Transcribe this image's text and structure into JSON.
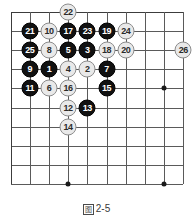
{
  "figure": {
    "caption": "图2-5",
    "caption_prefix_symbol": "图",
    "caption_number": "2-5"
  },
  "board": {
    "type": "go-board-corner-diagram",
    "columns": 10,
    "rows": 10,
    "left_edge_is_board_edge": true,
    "top_edge_is_board_edge": true,
    "line_color": "#5a5a5a",
    "edge_color": "#3c3c3c",
    "black_color": "#111111",
    "white_color": "#e9e9e9",
    "star_points": [
      {
        "col": 3,
        "row": 9
      },
      {
        "col": 8,
        "row": 4
      },
      {
        "col": 8,
        "row": 9
      }
    ]
  },
  "stones": [
    {
      "n": "22",
      "color": "white",
      "col": 3,
      "row": 0
    },
    {
      "n": "21",
      "color": "black",
      "col": 1,
      "row": 1
    },
    {
      "n": "10",
      "color": "white",
      "col": 2,
      "row": 1
    },
    {
      "n": "17",
      "color": "black",
      "col": 3,
      "row": 1
    },
    {
      "n": "23",
      "color": "black",
      "col": 4,
      "row": 1
    },
    {
      "n": "19",
      "color": "black",
      "col": 5,
      "row": 1
    },
    {
      "n": "24",
      "color": "white",
      "col": 6,
      "row": 1
    },
    {
      "n": "25",
      "color": "black",
      "col": 1,
      "row": 2
    },
    {
      "n": "8",
      "color": "white",
      "col": 2,
      "row": 2
    },
    {
      "n": "5",
      "color": "black",
      "col": 3,
      "row": 2
    },
    {
      "n": "3",
      "color": "black",
      "col": 4,
      "row": 2
    },
    {
      "n": "18",
      "color": "white",
      "col": 5,
      "row": 2
    },
    {
      "n": "20",
      "color": "white",
      "col": 6,
      "row": 2
    },
    {
      "n": "26",
      "color": "white",
      "col": 9,
      "row": 2
    },
    {
      "n": "9",
      "color": "black",
      "col": 1,
      "row": 3
    },
    {
      "n": "1",
      "color": "black",
      "col": 2,
      "row": 3
    },
    {
      "n": "4",
      "color": "white",
      "col": 3,
      "row": 3
    },
    {
      "n": "2",
      "color": "white",
      "col": 4,
      "row": 3
    },
    {
      "n": "7",
      "color": "black",
      "col": 5,
      "row": 3
    },
    {
      "n": "11",
      "color": "black",
      "col": 1,
      "row": 4
    },
    {
      "n": "6",
      "color": "white",
      "col": 2,
      "row": 4
    },
    {
      "n": "16",
      "color": "white",
      "col": 3,
      "row": 4
    },
    {
      "n": "15",
      "color": "black",
      "col": 5,
      "row": 4
    },
    {
      "n": "12",
      "color": "white",
      "col": 3,
      "row": 5
    },
    {
      "n": "13",
      "color": "black",
      "col": 4,
      "row": 5
    },
    {
      "n": "14",
      "color": "white",
      "col": 3,
      "row": 6
    }
  ]
}
